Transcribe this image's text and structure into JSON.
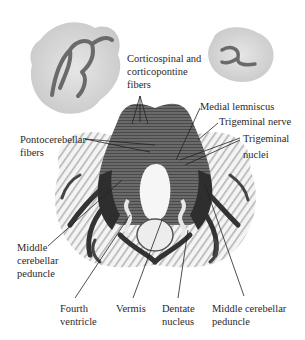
{
  "figure": {
    "type": "anatomical-illustration",
    "colors": {
      "background": "#ffffff",
      "gray_matter": "#d8d8d8",
      "white_matter": "#3a3a3a",
      "pons": "#5a5a5a",
      "text": "#2a2a2a",
      "leader": "#222222"
    }
  },
  "labels": {
    "corticospinal": {
      "line1": "Corticospinal and",
      "line2": "corticopontine",
      "line3": "fibers"
    },
    "medial_lemniscus": {
      "line1": "Medial lemniscus"
    },
    "trigeminal_nerve": {
      "line1": "Trigeminal nerve"
    },
    "trigeminal_nuclei": {
      "line1": "Trigeminal",
      "line2": "nuclei"
    },
    "pontocerebellar": {
      "line1": "Pontocerebellar",
      "line2": "fibers"
    },
    "middle_peduncle_left": {
      "line1": "Middle",
      "line2": "cerebellar",
      "line3": "peduncle"
    },
    "fourth_ventricle": {
      "line1": "Fourth",
      "line2": "ventricle"
    },
    "vermis": {
      "line1": "Vermis"
    },
    "dentate_nucleus": {
      "line1": "Dentate",
      "line2": "nucleus"
    },
    "middle_peduncle_right": {
      "line1": "Middle cerebellar",
      "line2": "peduncle"
    }
  }
}
